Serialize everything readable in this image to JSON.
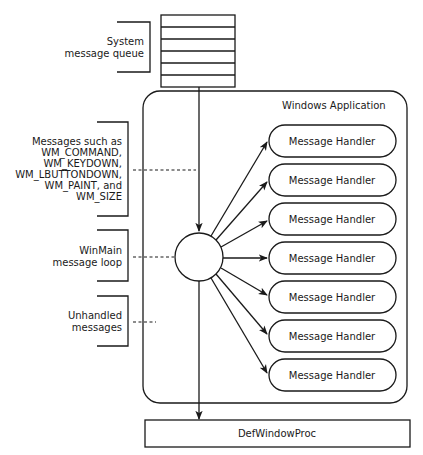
{
  "diagram": {
    "queue": {
      "label_lines": [
        "System",
        "message queue"
      ],
      "rows": 6
    },
    "app_box": {
      "title": "Windows Application"
    },
    "messages_annotation": {
      "label_lines": [
        "Messages such as",
        "WM_COMMAND,",
        "WM_KEYDOWN,",
        "WM_LBUTTONDOWN,",
        "WM_PAINT, and",
        "WM_SIZE"
      ]
    },
    "loop_annotation": {
      "label_lines": [
        "WinMain",
        "message loop"
      ]
    },
    "unhandled_annotation": {
      "label_lines": [
        "Unhandled",
        "messages"
      ]
    },
    "handlers": [
      {
        "label": "Message Handler"
      },
      {
        "label": "Message Handler"
      },
      {
        "label": "Message Handler"
      },
      {
        "label": "Message Handler"
      },
      {
        "label": "Message Handler"
      },
      {
        "label": "Message Handler"
      },
      {
        "label": "Message Handler"
      }
    ],
    "default_proc": {
      "label": "DefWindowProc"
    }
  }
}
